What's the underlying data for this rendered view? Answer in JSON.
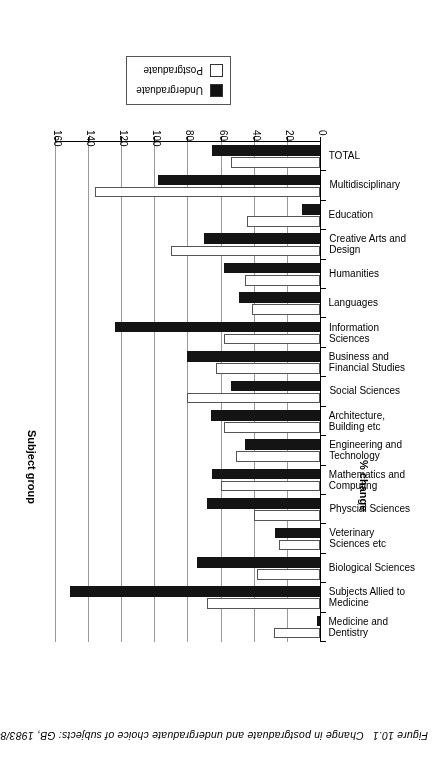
{
  "figure": {
    "number": "Figure 10.1",
    "caption": "Change in postgraduate and undergraduate choice of subjects: GB, 1983/84 to 1993/94"
  },
  "legend": {
    "items": [
      {
        "label": "Undergraduate",
        "color": "#141414",
        "swatch": "dark"
      },
      {
        "label": "Postgraduate",
        "color": "#ffffff",
        "swatch": "light"
      }
    ]
  },
  "axes": {
    "value_title": "% change",
    "category_title": "Subject group",
    "ticks": [
      "0",
      "20",
      "40",
      "60",
      "80",
      "100",
      "120",
      "140",
      "160"
    ]
  },
  "chart_data": {
    "type": "bar",
    "orientation": "horizontal",
    "title": "Change in postgraduate and undergraduate choice of subjects: GB, 1983/84 to 1993/94",
    "xlabel": "% change",
    "ylabel": "Subject group",
    "xlim": [
      0,
      160
    ],
    "grid": true,
    "legend_position": "top-right",
    "categories": [
      "Medicine and Dentistry",
      "Subjects Allied to Medicine",
      "Biological Sciences",
      "Veterinary Sciences etc",
      "Physcial Sciences",
      "Mathematics and Computing",
      "Engineering and Technology",
      "Architecture, Building etc",
      "Social Sciences",
      "Business and Financial Studies",
      "Information Sciences",
      "Languages",
      "Humanities",
      "Creative Arts and Design",
      "Education",
      "Multidisciplinary",
      "TOTAL"
    ],
    "category_lines": [
      [
        "Medicine and",
        "Dentistry"
      ],
      [
        "Subjects Allied to",
        "Medicine"
      ],
      [
        "Biological Sciences"
      ],
      [
        "Veterinary",
        "Sciences etc"
      ],
      [
        "Physcial Sciences"
      ],
      [
        "Mathematics and",
        "Computing"
      ],
      [
        "Engineering and",
        "Technology"
      ],
      [
        "Architecture,",
        "Building etc"
      ],
      [
        "Social Sciences"
      ],
      [
        "Business and",
        "Financial Studies"
      ],
      [
        "Information",
        "Sciences"
      ],
      [
        "Languages"
      ],
      [
        "Humanities"
      ],
      [
        "Creative Arts and",
        "Design"
      ],
      [
        "Education"
      ],
      [
        "Multidisciplinary"
      ],
      [
        "TOTAL"
      ]
    ],
    "series": [
      {
        "name": "Undergraduate",
        "color": "#141414",
        "values": [
          2,
          151,
          74,
          27,
          68,
          65,
          45,
          66,
          54,
          80,
          124,
          49,
          58,
          70,
          11,
          98,
          65
        ]
      },
      {
        "name": "Postgraduate",
        "color": "#ffffff",
        "values": [
          28,
          68,
          38,
          25,
          40,
          60,
          51,
          58,
          80,
          63,
          58,
          41,
          45,
          90,
          44,
          136,
          54
        ]
      }
    ]
  }
}
